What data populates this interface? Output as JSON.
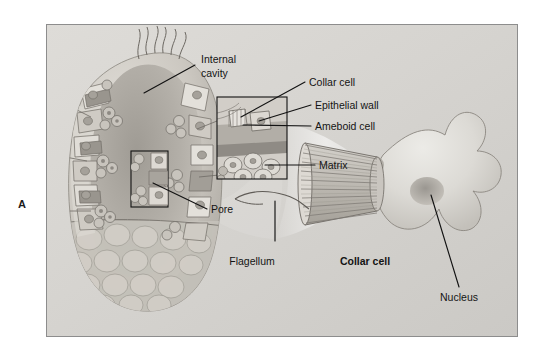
{
  "figure": {
    "panel_label": "A",
    "background_color": "#d9d9d9",
    "frame_border_color": "#8d8d8d",
    "label_color": "#141414"
  },
  "labels": {
    "internal_cavity_line1": "Internal",
    "internal_cavity_line2": "cavity",
    "collar_cell_inset": "Collar cell",
    "epithelial_wall": "Epithelial wall",
    "ameboid_cell": "Ameboid cell",
    "matrix": "Matrix",
    "pore": "Pore",
    "flagellum": "Flagellum",
    "collar_cell_main": "Collar cell",
    "nucleus": "Nucleus"
  },
  "illustration": {
    "subject": "sponge body cutaway with magnified collar cell",
    "sponge_fill_light": "#cfcbc4",
    "sponge_fill_mid": "#b6b2ab",
    "sponge_fill_dark": "#8f8b85",
    "cell_outline": "#6e6a64",
    "collar_stripe_color": "#7d7974",
    "nucleus_shade": "#9e9a94"
  }
}
